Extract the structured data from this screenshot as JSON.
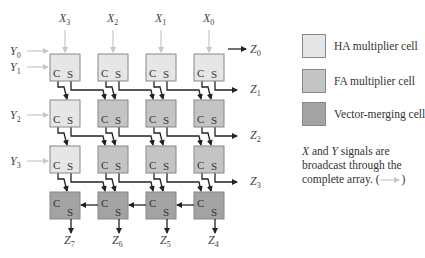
{
  "diagram": {
    "inputs_x": [
      "X3",
      "X2",
      "X1",
      "X0"
    ],
    "inputs_y": [
      "Y0",
      "Y1",
      "Y2",
      "Y3"
    ],
    "outputs_right": [
      "Z0",
      "Z1",
      "Z2",
      "Z3"
    ],
    "outputs_bottom": [
      "Z7",
      "Z6",
      "Z5",
      "Z4"
    ],
    "cell_carry_label": "C",
    "cell_sum_label": "S",
    "rows": [
      {
        "cells": [
          "HA",
          "HA",
          "HA",
          "HA"
        ]
      },
      {
        "cells": [
          "HA",
          "FA",
          "FA",
          "FA"
        ]
      },
      {
        "cells": [
          "HA",
          "FA",
          "FA",
          "FA"
        ]
      },
      {
        "cells": [
          "VM",
          "VM",
          "VM",
          "VM"
        ]
      }
    ],
    "colors": {
      "HA": "#e6e6e6",
      "FA": "#c4c4c4",
      "VM": "#a3a3a3",
      "broadcast_arrow": "#c8c8c8",
      "wire": "#222222"
    }
  },
  "legend": {
    "items": [
      {
        "label": "HA multiplier cell",
        "color": "#e6e6e6"
      },
      {
        "label": "FA multiplier cell",
        "color": "#c4c4c4"
      },
      {
        "label": "Vector-merging cell",
        "color": "#a3a3a3"
      }
    ],
    "note_x": "X",
    "note_and": " and ",
    "note_y": "Y",
    "note_rest": " signals are broadcast through the complete array. (",
    "note_close": ")"
  }
}
